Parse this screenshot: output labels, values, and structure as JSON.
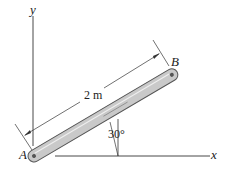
{
  "labels": {
    "y_axis": "y",
    "x_axis": "x",
    "point_a": "A",
    "point_b": "B",
    "length": "2 m",
    "angle": "30°"
  },
  "colors": {
    "rod_fill": "#c9c9c9",
    "rod_stroke": "#555555",
    "line": "#333333"
  }
}
